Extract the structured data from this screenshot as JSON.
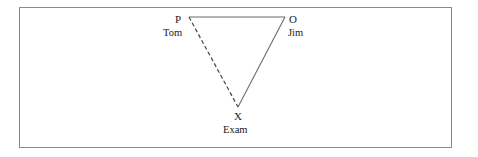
{
  "figure": {
    "background_color": "#ffffff",
    "border_color": "#8a8a8a",
    "line_color": "#555555",
    "dashed_line_color": "#444444",
    "text_color": "#1a1a1a"
  },
  "nodes": [
    {
      "id": "P",
      "vertex_label": "P",
      "person_label": "Tom",
      "x": 189,
      "y": 17
    },
    {
      "id": "O",
      "vertex_label": "O",
      "person_label": "Jim",
      "x": 285,
      "y": 17
    },
    {
      "id": "X",
      "vertex_label": "X",
      "person_label": "Exam",
      "x": 238,
      "y": 107
    }
  ],
  "edges": [
    {
      "id": "P-O",
      "from": "P",
      "to": "O",
      "style": "solid"
    },
    {
      "id": "O-X",
      "from": "O",
      "to": "X",
      "style": "solid"
    },
    {
      "id": "P-X",
      "from": "P",
      "to": "X",
      "style": "dashed"
    }
  ]
}
